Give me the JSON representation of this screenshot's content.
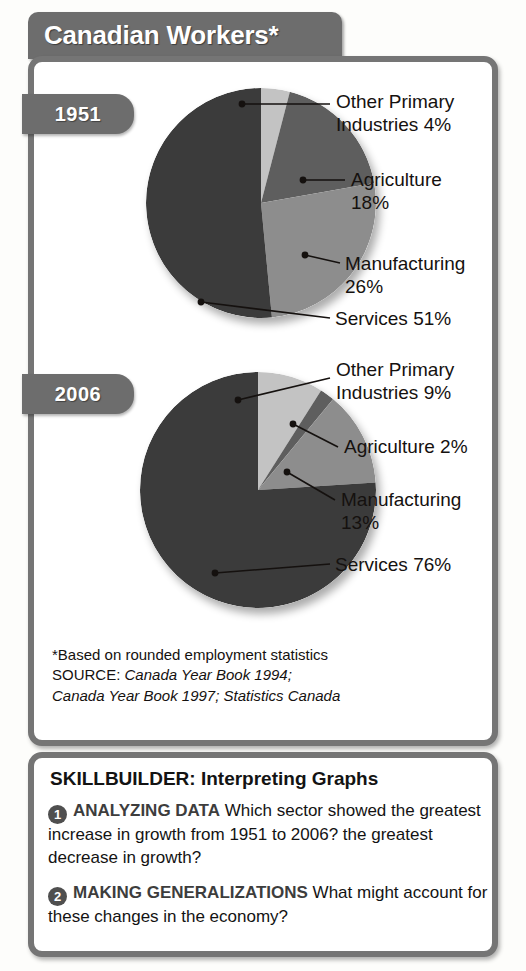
{
  "title": "Canadian Workers*",
  "tabs": [
    {
      "name": "1951",
      "label": "1951"
    },
    {
      "name": "2006",
      "label": "2006"
    }
  ],
  "colors": {
    "services": "#3b3b3b",
    "manufacturing": "#8d8d8d",
    "agriculture": "#5e5e5e",
    "other_primary": "#c3c3c3",
    "frame": "#757575",
    "banner": "#6d6d6d",
    "text": "#15110f"
  },
  "callouts_1951": {
    "other_primary": "Other Primary\nIndustries 4%",
    "agriculture": "Agriculture\n18%",
    "manufacturing": "Manufacturing\n26%",
    "services": "Services 51%"
  },
  "callouts_2006": {
    "other_primary": "Other Primary\nIndustries 9%",
    "agriculture": "Agriculture 2%",
    "manufacturing": "Manufacturing\n13%",
    "services": "Services 76%"
  },
  "source": {
    "footnote": "*Based on rounded employment statistics",
    "source_label": "SOURCE:",
    "source_line1": "Canada Year Book 1994;",
    "source_line2": "Canada Year Book 1997; Statistics Canada"
  },
  "skillbuilder": {
    "title": "SKILLBUILDER: Interpreting Graphs",
    "questions": [
      {
        "number": "1",
        "category": "ANALYZING DATA",
        "text": "Which sector showed the greatest increase in growth from 1951 to 2006? the greatest decrease in growth?"
      },
      {
        "number": "2",
        "category": "MAKING GENERALIZATIONS",
        "text": "What might account for these changes in the economy?"
      }
    ]
  },
  "chart_data": [
    {
      "type": "pie",
      "title": "1951",
      "categories": [
        "Other Primary Industries",
        "Agriculture",
        "Manufacturing",
        "Services"
      ],
      "values": [
        4,
        18,
        26,
        51
      ],
      "value_labels": [
        "4%",
        "18%",
        "26%",
        "51%"
      ],
      "colors": [
        "#c3c3c3",
        "#5e5e5e",
        "#8d8d8d",
        "#3b3b3b"
      ],
      "units": "percent",
      "start_angle_deg": 0,
      "direction": "clockwise",
      "legend": "callout-labels"
    },
    {
      "type": "pie",
      "title": "2006",
      "categories": [
        "Other Primary Industries",
        "Agriculture",
        "Manufacturing",
        "Services"
      ],
      "values": [
        9,
        2,
        13,
        76
      ],
      "value_labels": [
        "9%",
        "2%",
        "13%",
        "76%"
      ],
      "colors": [
        "#c3c3c3",
        "#5e5e5e",
        "#8d8d8d",
        "#3b3b3b"
      ],
      "units": "percent",
      "start_angle_deg": 0,
      "direction": "clockwise",
      "legend": "callout-labels"
    }
  ]
}
